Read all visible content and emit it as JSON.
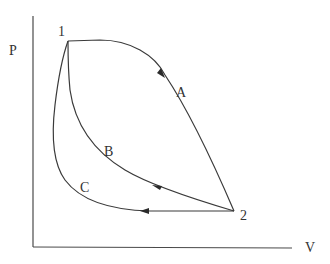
{
  "diagram": {
    "type": "pv-diagram",
    "axes": {
      "y_label": "P",
      "x_label": "V"
    },
    "points": [
      {
        "id": "1",
        "label": "1"
      },
      {
        "id": "2",
        "label": "2"
      }
    ],
    "paths": [
      {
        "id": "A",
        "label": "A",
        "from": "1",
        "to": "2",
        "direction": "1 to 2"
      },
      {
        "id": "B",
        "label": "B",
        "from": "2",
        "to": "1",
        "direction": "2 to 1"
      },
      {
        "id": "C",
        "label": "C",
        "from": "2",
        "to": "1",
        "direction": "2 to 1"
      }
    ],
    "colors": {
      "line": "#3a3a3a",
      "text": "#333333",
      "background": "#ffffff"
    }
  }
}
